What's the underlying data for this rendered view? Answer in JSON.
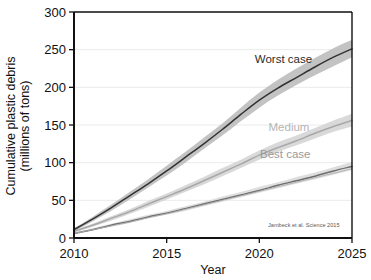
{
  "chart_data": {
    "type": "line",
    "title": "",
    "xlabel": "Year",
    "ylabel": "Cumulative plastic debris (millions of tons)",
    "ylabel_line1": "Cumulative plastic debris",
    "ylabel_line2": "(millions of tons)",
    "xlim": [
      2010,
      2025
    ],
    "ylim": [
      0,
      300
    ],
    "xticks": [
      2010,
      2015,
      2020,
      2025
    ],
    "yticks": [
      0,
      50,
      100,
      150,
      200,
      250,
      300
    ],
    "xtick_labels": [
      "2010",
      "2015",
      "2020",
      "2025"
    ],
    "ytick_labels": [
      "0",
      "50",
      "100",
      "150",
      "200",
      "250",
      "300"
    ],
    "grid": "horizontal",
    "legend": "inline-annotations",
    "annotations": [
      {
        "text": "Worst case",
        "x": 2021.3,
        "y": 232
      },
      {
        "text": "Medium",
        "x": 2021.6,
        "y": 142
      },
      {
        "text": "Best case",
        "x": 2021.4,
        "y": 106
      },
      {
        "text": "Jambeck et al. Science 2015",
        "x": 2022.4,
        "y": 14
      }
    ],
    "x": [
      2010,
      2011,
      2012,
      2013,
      2014,
      2015,
      2016,
      2017,
      2018,
      2019,
      2020,
      2021,
      2022,
      2023,
      2024,
      2025
    ],
    "series": [
      {
        "name": "Worst case",
        "color": "#333333",
        "band_color": "#b9b9b9",
        "values": [
          11,
          25,
          40,
          56,
          72,
          89,
          107,
          125,
          144,
          164,
          183,
          199,
          213,
          227,
          240,
          251
        ],
        "band_low": [
          9,
          22,
          36,
          51,
          67,
          83,
          100,
          118,
          136,
          155,
          173,
          189,
          203,
          216,
          228,
          240
        ],
        "band_high": [
          13,
          28,
          44,
          61,
          78,
          96,
          114,
          133,
          152,
          173,
          193,
          210,
          225,
          239,
          252,
          263
        ]
      },
      {
        "name": "Medium",
        "color": "#a8a8a8",
        "band_color": "#d2d2d2",
        "values": [
          9,
          17,
          26,
          35,
          45,
          55,
          65,
          76,
          87,
          98,
          110,
          120,
          129,
          139,
          148,
          156
        ],
        "band_low": [
          7,
          15,
          23,
          32,
          41,
          51,
          61,
          71,
          82,
          93,
          104,
          114,
          123,
          132,
          141,
          148
        ],
        "band_high": [
          11,
          19,
          29,
          38,
          49,
          59,
          70,
          81,
          93,
          104,
          116,
          127,
          136,
          146,
          156,
          165
        ]
      },
      {
        "name": "Best case",
        "color": "#6e6e6e",
        "band_color": "#d8d8d8",
        "values": [
          6,
          11,
          17,
          22,
          28,
          33,
          39,
          45,
          51,
          57,
          63,
          70,
          76,
          82,
          89,
          95
        ],
        "band_low": [
          5,
          10,
          15,
          20,
          26,
          31,
          36,
          42,
          48,
          54,
          60,
          66,
          72,
          78,
          84,
          90
        ],
        "band_high": [
          7,
          13,
          19,
          25,
          31,
          36,
          42,
          48,
          55,
          61,
          68,
          74,
          81,
          87,
          94,
          101
        ]
      },
      {
        "name": "Lower bound",
        "color": "#b0b0b0",
        "band_color": "none",
        "values": [
          6,
          11,
          16,
          21,
          27,
          32,
          38,
          44,
          50,
          56,
          62,
          68,
          74,
          80,
          86,
          92
        ],
        "band_low": [],
        "band_high": []
      }
    ]
  }
}
